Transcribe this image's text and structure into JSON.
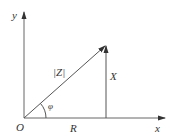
{
  "diagram": {
    "labels": {
      "y_axis": "y",
      "x_axis": "x",
      "origin": "O",
      "magnitude": "|Z|",
      "reactance": "X",
      "resistance": "R",
      "angle": "φ"
    },
    "colors": {
      "line": "#555555",
      "text": "#333333"
    }
  }
}
